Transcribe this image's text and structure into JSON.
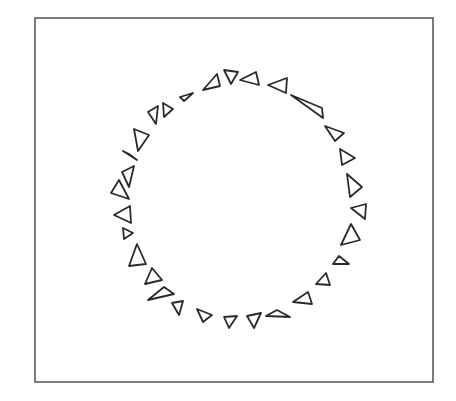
{
  "figure": {
    "type": "line-drawing",
    "frame": {
      "x": 35,
      "y": 18,
      "width": 398,
      "height": 364,
      "stroke": "#5a5a5a"
    },
    "stroke_color": "#2a2a2a",
    "background": "#ffffff",
    "triangle_count": 30,
    "triangles": [
      [
        [
          148,
          112
        ],
        [
          158,
          106
        ],
        [
          156,
          124
        ]
      ],
      [
        [
          163,
          103
        ],
        [
          173,
          109
        ],
        [
          164,
          117
        ]
      ],
      [
        [
          180,
          97
        ],
        [
          193,
          93
        ],
        [
          184,
          101
        ]
      ],
      [
        [
          203,
          90
        ],
        [
          217,
          74
        ],
        [
          220,
          86
        ]
      ],
      [
        [
          224,
          70
        ],
        [
          238,
          72
        ],
        [
          231,
          84
        ]
      ],
      [
        [
          240,
          80
        ],
        [
          256,
          72
        ],
        [
          259,
          85
        ]
      ],
      [
        [
          268,
          85
        ],
        [
          287,
          78
        ],
        [
          286,
          93
        ]
      ],
      [
        [
          291,
          95
        ],
        [
          322,
          108
        ],
        [
          323,
          118
        ]
      ],
      [
        [
          325,
          126
        ],
        [
          344,
          133
        ],
        [
          335,
          141
        ]
      ],
      [
        [
          340,
          149
        ],
        [
          355,
          158
        ],
        [
          342,
          165
        ]
      ],
      [
        [
          347,
          174
        ],
        [
          362,
          187
        ],
        [
          350,
          197
        ]
      ],
      [
        [
          351,
          208
        ],
        [
          366,
          204
        ],
        [
          365,
          219
        ]
      ],
      [
        [
          341,
          245
        ],
        [
          351,
          224
        ],
        [
          360,
          240
        ]
      ],
      [
        [
          333,
          264
        ],
        [
          339,
          256
        ],
        [
          349,
          264
        ]
      ],
      [
        [
          316,
          284
        ],
        [
          326,
          273
        ],
        [
          330,
          285
        ]
      ],
      [
        [
          293,
          302
        ],
        [
          308,
          292
        ],
        [
          312,
          304
        ]
      ],
      [
        [
          266,
          316
        ],
        [
          277,
          310
        ],
        [
          290,
          317
        ]
      ],
      [
        [
          247,
          316
        ],
        [
          261,
          313
        ],
        [
          254,
          328
        ]
      ],
      [
        [
          224,
          317
        ],
        [
          237,
          316
        ],
        [
          229,
          328
        ]
      ],
      [
        [
          197,
          309
        ],
        [
          212,
          315
        ],
        [
          203,
          322
        ]
      ],
      [
        [
          172,
          303
        ],
        [
          183,
          301
        ],
        [
          179,
          315
        ]
      ],
      [
        [
          148,
          300
        ],
        [
          164,
          287
        ],
        [
          174,
          294
        ]
      ],
      [
        [
          145,
          284
        ],
        [
          152,
          268
        ],
        [
          162,
          280
        ]
      ],
      [
        [
          129,
          266
        ],
        [
          137,
          244
        ],
        [
          146,
          264
        ]
      ],
      [
        [
          123,
          228
        ],
        [
          133,
          233
        ],
        [
          124,
          239
        ]
      ],
      [
        [
          114,
          215
        ],
        [
          130,
          206
        ],
        [
          131,
          223
        ]
      ],
      [
        [
          111,
          193
        ],
        [
          119,
          180
        ],
        [
          129,
          199
        ]
      ],
      [
        [
          122,
          172
        ],
        [
          134,
          166
        ],
        [
          129,
          187
        ]
      ],
      [
        [
          123,
          151
        ],
        [
          129,
          154
        ],
        [
          137,
          160
        ]
      ],
      [
        [
          134,
          129
        ],
        [
          149,
          135
        ],
        [
          138,
          151
        ]
      ]
    ]
  }
}
